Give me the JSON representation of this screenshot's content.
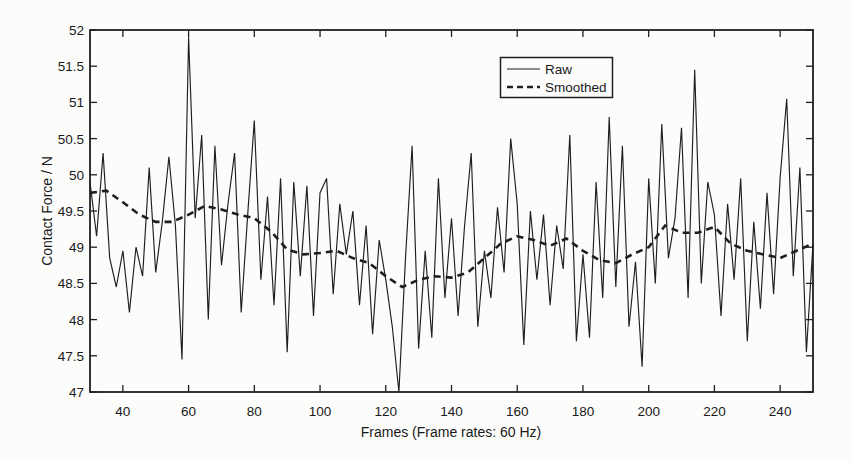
{
  "colors": {
    "line": "#1f1f1f",
    "text": "#191919",
    "background": "#fcfcfb",
    "plot_border": "#1f1f1f"
  },
  "chart_data": {
    "type": "line",
    "title": "",
    "xlabel": "Frames (Frame rates: 60 Hz)",
    "ylabel": "Contact Force / N",
    "xlim": [
      30,
      250
    ],
    "ylim": [
      47,
      52
    ],
    "xticks": [
      40,
      60,
      80,
      100,
      120,
      140,
      160,
      180,
      200,
      220,
      240
    ],
    "yticks": [
      47,
      47.5,
      48,
      48.5,
      49,
      49.5,
      50,
      50.5,
      51,
      51.5,
      52
    ],
    "grid": false,
    "legend": {
      "position": "top-center-right",
      "entries": [
        {
          "label": "Raw",
          "style": "solid"
        },
        {
          "label": "Smoothed",
          "style": "dashed"
        }
      ]
    },
    "series": [
      {
        "name": "Raw",
        "style": "solid",
        "x": [
          30,
          32,
          34,
          36,
          38,
          40,
          42,
          44,
          46,
          48,
          50,
          52,
          54,
          56,
          58,
          60,
          62,
          64,
          66,
          68,
          70,
          72,
          74,
          76,
          78,
          80,
          82,
          84,
          86,
          88,
          90,
          92,
          94,
          96,
          98,
          100,
          102,
          104,
          106,
          108,
          110,
          112,
          114,
          116,
          118,
          120,
          122,
          124,
          126,
          128,
          130,
          132,
          134,
          136,
          138,
          140,
          142,
          144,
          146,
          148,
          150,
          152,
          154,
          156,
          158,
          160,
          162,
          164,
          166,
          168,
          170,
          172,
          174,
          176,
          178,
          180,
          182,
          184,
          186,
          188,
          190,
          192,
          194,
          196,
          198,
          200,
          202,
          204,
          206,
          208,
          210,
          212,
          214,
          216,
          218,
          220,
          222,
          224,
          226,
          228,
          230,
          232,
          234,
          236,
          238,
          240,
          242,
          244,
          246,
          248,
          250
        ],
        "values": [
          49.9,
          49.15,
          50.3,
          48.85,
          48.45,
          48.95,
          48.1,
          49.0,
          48.6,
          50.1,
          48.65,
          49.35,
          50.25,
          49.3,
          47.45,
          51.9,
          49.4,
          50.55,
          48.0,
          50.4,
          48.75,
          49.6,
          50.3,
          48.1,
          49.45,
          50.75,
          48.55,
          49.7,
          48.2,
          49.95,
          47.55,
          49.9,
          48.6,
          49.85,
          48.05,
          49.75,
          49.95,
          48.35,
          49.6,
          48.9,
          49.5,
          48.2,
          49.3,
          47.8,
          49.1,
          48.55,
          47.9,
          47.0,
          48.85,
          50.4,
          47.6,
          48.95,
          47.75,
          49.95,
          48.3,
          49.4,
          48.05,
          49.3,
          50.3,
          47.9,
          48.95,
          48.3,
          49.55,
          48.65,
          50.5,
          49.6,
          47.65,
          49.5,
          48.55,
          49.45,
          48.2,
          49.3,
          48.7,
          50.55,
          47.7,
          48.9,
          47.75,
          49.9,
          48.3,
          50.8,
          48.45,
          50.4,
          47.9,
          48.8,
          47.35,
          49.95,
          48.5,
          50.7,
          48.85,
          49.4,
          50.65,
          48.3,
          51.45,
          48.5,
          49.9,
          49.45,
          48.05,
          49.6,
          48.55,
          49.95,
          47.7,
          49.35,
          48.15,
          49.75,
          48.35,
          49.95,
          51.05,
          48.6,
          50.1,
          47.55,
          49.05
        ]
      },
      {
        "name": "Smoothed",
        "style": "dashed",
        "x": [
          30,
          35,
          40,
          45,
          50,
          55,
          60,
          65,
          70,
          75,
          80,
          85,
          90,
          95,
          100,
          105,
          110,
          115,
          120,
          125,
          130,
          135,
          140,
          145,
          150,
          155,
          160,
          165,
          170,
          175,
          180,
          185,
          190,
          195,
          200,
          205,
          210,
          215,
          220,
          225,
          230,
          235,
          240,
          245,
          250
        ],
        "values": [
          49.75,
          49.78,
          49.62,
          49.45,
          49.35,
          49.35,
          49.45,
          49.57,
          49.52,
          49.45,
          49.4,
          49.22,
          48.97,
          48.9,
          48.92,
          48.95,
          48.85,
          48.78,
          48.6,
          48.45,
          48.55,
          48.6,
          48.58,
          48.65,
          48.85,
          49.05,
          49.15,
          49.1,
          49.02,
          49.12,
          48.95,
          48.82,
          48.78,
          48.9,
          49.0,
          49.3,
          49.2,
          49.2,
          49.28,
          49.05,
          48.95,
          48.9,
          48.85,
          48.95,
          49.05
        ]
      }
    ]
  }
}
